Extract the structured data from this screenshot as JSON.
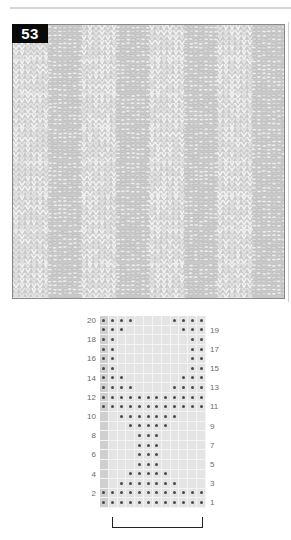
{
  "page": {
    "pattern_number": "53",
    "photo_alt": "knitted swatch with alternating knit and purl block texture"
  },
  "chart": {
    "columns": 12,
    "rows": 20,
    "symbol": "dot-purl",
    "left_labels": [
      "20",
      "18",
      "16",
      "14",
      "12",
      "10",
      "8",
      "6",
      "4",
      "2"
    ],
    "right_labels": [
      "19",
      "17",
      "15",
      "13",
      "11",
      "9",
      "7",
      "5",
      "3",
      "1"
    ],
    "row_dots": {
      "20": [
        1,
        2,
        3,
        4,
        9,
        10,
        11,
        12
      ],
      "19": [
        1,
        2,
        3,
        10,
        11,
        12
      ],
      "18": [
        1,
        2,
        11,
        12
      ],
      "17": [
        1,
        2,
        11,
        12
      ],
      "16": [
        1,
        2,
        11,
        12
      ],
      "15": [
        1,
        2,
        11,
        12
      ],
      "14": [
        1,
        2,
        3,
        10,
        11,
        12
      ],
      "13": [
        1,
        2,
        3,
        4,
        9,
        10,
        11,
        12
      ],
      "12": [
        1,
        2,
        3,
        4,
        5,
        6,
        7,
        8,
        9,
        10,
        11,
        12
      ],
      "11": [
        1,
        2,
        3,
        4,
        5,
        6,
        7,
        8,
        9,
        10,
        11,
        12
      ],
      "10": [
        3,
        4,
        5,
        6,
        7,
        8,
        9
      ],
      "9": [
        4,
        5,
        6,
        7,
        8
      ],
      "8": [
        5,
        6,
        7
      ],
      "7": [
        5,
        6,
        7
      ],
      "6": [
        5,
        6,
        7
      ],
      "5": [
        5,
        6,
        7
      ],
      "4": [
        4,
        5,
        6,
        7,
        8
      ],
      "3": [
        3,
        4,
        5,
        6,
        7,
        8,
        9
      ],
      "2": [
        1,
        2,
        3,
        4,
        5,
        6,
        7,
        8,
        9,
        10,
        11,
        12
      ],
      "1": [
        1,
        2,
        3,
        4,
        5,
        6,
        7,
        8,
        9,
        10,
        11,
        12
      ]
    },
    "edge_column": 1,
    "repeat_bracket": {
      "from_col": 2,
      "to_col": 12
    }
  },
  "colors": {
    "label_bg": "#0a0a0a",
    "label_text": "#ffffff",
    "grid_bg": "#e4e4e4",
    "edge_bg": "#cfcfcf",
    "dot": "#4a4a4a"
  }
}
